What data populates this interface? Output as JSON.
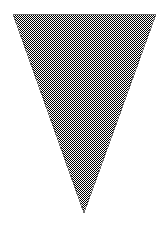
{
  "canvas": {
    "width": 168,
    "height": 231,
    "background_color": "#ffffff",
    "label": "inverted-triangle-figure"
  },
  "figure": {
    "name": "inverted-triangle",
    "shape_type": "triangle",
    "orientation": "point-down",
    "fill_style": "checkerboard-dither",
    "fill_appearance_color": "#808080",
    "dither_dark_color": "#000000",
    "dither_light_color": "#ffffff",
    "dither_cell_size_px": 1,
    "outline_color": "#6e6e6e",
    "outline_width_px": 1,
    "vertices": [
      {
        "name": "top-left",
        "x": 13,
        "y": 14
      },
      {
        "name": "top-right",
        "x": 156,
        "y": 14
      },
      {
        "name": "bottom-apex",
        "x": 84,
        "y": 213
      }
    ],
    "points_attr": "13,14 156,14 84,213",
    "bounding_box": {
      "x": 13,
      "y": 14,
      "width": 143,
      "height": 199
    },
    "top_edge_width_px": 143,
    "height_px": 199
  },
  "annotations": {
    "text_present": "none",
    "axes_present": "none",
    "legend_present": "none"
  }
}
